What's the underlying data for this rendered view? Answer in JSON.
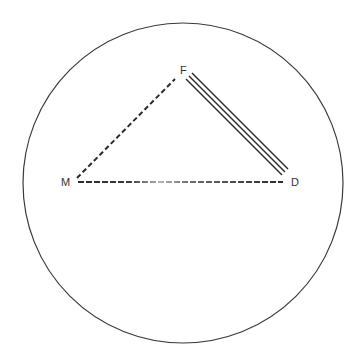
{
  "diagram": {
    "type": "relationship-triangle-in-circle",
    "boundary": {
      "shape": "circle",
      "cx": 183,
      "cy": 183,
      "r": 160,
      "stroke": "#3a3a3a"
    },
    "nodes": [
      {
        "id": "F",
        "label": "F",
        "x": 183,
        "y": 73
      },
      {
        "id": "M",
        "label": "M",
        "x": 67,
        "y": 186
      },
      {
        "id": "D",
        "label": "D",
        "x": 295,
        "y": 186
      }
    ],
    "edges": [
      {
        "from": "M",
        "to": "F",
        "style": "dashed",
        "x1": 77,
        "y1": 178,
        "x2": 175,
        "y2": 79
      },
      {
        "from": "M",
        "to": "D",
        "style": "dashed-faded-middle",
        "x1": 78,
        "y1": 182,
        "x2": 283,
        "y2": 182
      },
      {
        "from": "F",
        "to": "D",
        "style": "triple-line",
        "x1": 189,
        "y1": 76,
        "x2": 285,
        "y2": 172
      }
    ],
    "colors": {
      "line": "#2a2a2a",
      "label": "#333333",
      "background": "#ffffff"
    }
  }
}
